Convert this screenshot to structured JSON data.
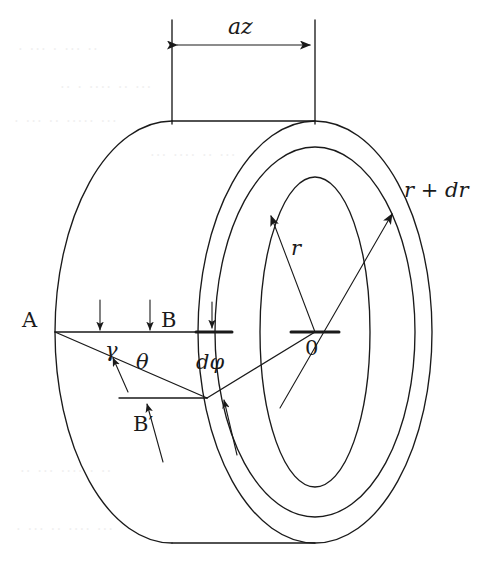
{
  "figure": {
    "stroke_color": "#1a1a1a",
    "background_color": "#ffffff"
  },
  "labels": {
    "axial_thickness": "az",
    "radius_inner": "r",
    "radius_outer": "r + dr",
    "center": "0",
    "point_a": "A",
    "point_b": "B",
    "point_b_prime": "B′",
    "angle_gamma": "γ",
    "angle_theta": "θ",
    "angle_dphi": "dφ"
  },
  "geometry": {
    "front_face_center": {
      "x": 172,
      "y": 332
    },
    "back_face_center": {
      "x": 315,
      "y": 332
    },
    "front_outer_rx": 117,
    "front_outer_ry": 211,
    "back_outer_rx": 117,
    "back_outer_ry": 211,
    "back_mid_rx": 100,
    "back_mid_ry": 185,
    "back_inner_rx": 55,
    "back_inner_ry": 155,
    "point_a": {
      "x": 55,
      "y": 332
    },
    "point_b": {
      "x": 172,
      "y": 332
    },
    "point_b_prime": {
      "x": 207,
      "y": 398
    },
    "dimension_line_y": 45,
    "dimension_left_x": 172,
    "dimension_right_x": 315,
    "extension_top_y": 20,
    "extension_bottom_y": 124,
    "bottom_tangent_y": 543
  },
  "annotations": {
    "load_arrows_on_ab": [
      {
        "x": 100,
        "from_y": 300,
        "to_y": 330
      },
      {
        "x": 150,
        "from_y": 300,
        "to_y": 330
      }
    ],
    "dphi_tick_arrow": {
      "x": 212,
      "from_y": 302,
      "to_y": 328
    },
    "gamma_pointer": {
      "from_x": 128,
      "from_y": 392,
      "to_x": 112,
      "to_y": 360
    },
    "b_prime_pointer": {
      "from_x": 163,
      "from_y": 462,
      "to_x": 147,
      "to_y": 404
    },
    "dphi_pointer": {
      "from_x": 237,
      "from_y": 455,
      "to_x": 224,
      "to_y": 402
    }
  },
  "bleed_through": [
    {
      "text": "·   ···   · ··· ··",
      "x": 18,
      "y": 40,
      "size": 15
    },
    {
      "text": "··  · ····  ·· ···",
      "x": 60,
      "y": 78,
      "size": 15
    },
    {
      "text": "·  ··· ··  ····· ···",
      "x": 14,
      "y": 112,
      "size": 15
    },
    {
      "text": "··· ····  ·· ···",
      "x": 150,
      "y": 146,
      "size": 15
    },
    {
      "text": "·· ··· ···· · ··",
      "x": 20,
      "y": 462,
      "size": 15
    },
    {
      "text": "· ··· ·· ···· ···",
      "x": 16,
      "y": 520,
      "size": 15
    }
  ]
}
